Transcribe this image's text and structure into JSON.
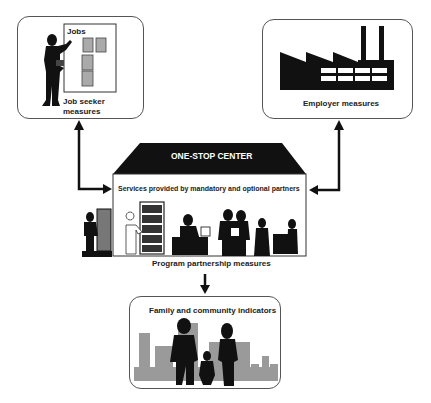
{
  "job_seeker": {
    "board_title": "Jobs",
    "label_line1": "Job seeker",
    "label_line2": "measures"
  },
  "employer": {
    "label": "Employer measures"
  },
  "one_stop": {
    "roof_title": "ONE-STOP CENTER",
    "services_label": "Services provided by mandatory and optional partners",
    "partnership_label": "Program partnership measures"
  },
  "family": {
    "label": "Family and community indicators"
  },
  "colors": {
    "ink": "#111111",
    "gray": "#9a9a9a",
    "box_border": "#555555"
  }
}
